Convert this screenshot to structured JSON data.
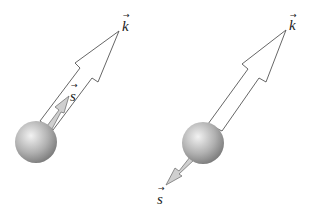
{
  "diagrams": [
    {
      "name": "spin-parallel",
      "k_label": "k",
      "s_label": "s",
      "vector_mark": "→",
      "s_direction": "along k"
    },
    {
      "name": "spin-antiparallel",
      "k_label": "k",
      "s_label": "s",
      "vector_mark": "→",
      "s_direction": "opposite k"
    }
  ],
  "colors": {
    "outline": "#555555",
    "sphere_light": "#eeeeee",
    "sphere_dark": "#777777",
    "s_arrow_fill": "#c8c8c8"
  }
}
